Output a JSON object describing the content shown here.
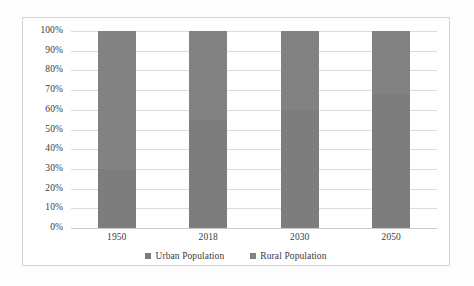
{
  "chart_data": {
    "type": "bar",
    "subtype": "100% stacked bar",
    "title": "",
    "xlabel": "",
    "ylabel": "",
    "categories": [
      "1950",
      "2018",
      "2030",
      "2050"
    ],
    "series": [
      {
        "name": "Urban Population",
        "color": "#7d7d7d",
        "values": [
          30,
          55,
          60,
          68
        ]
      },
      {
        "name": "Rural Population",
        "color": "#828282",
        "values": [
          70,
          45,
          40,
          32
        ]
      }
    ],
    "ylim": [
      0,
      100
    ],
    "y_tick_values": [
      0,
      10,
      20,
      30,
      40,
      50,
      60,
      70,
      80,
      90,
      100
    ],
    "y_tick_labels": [
      "0%",
      "10%",
      "20%",
      "30%",
      "40%",
      "50%",
      "60%",
      "70%",
      "80%",
      "90%",
      "100%"
    ],
    "grid": true,
    "grid_axis": "y",
    "legend_position": "bottom",
    "legend_entries": [
      "Urban Population",
      "Rural Population"
    ]
  },
  "style": {
    "plot_background": "#ffffff",
    "frame_border": "#d4d4d4",
    "gridline_color": "#dcdcdc",
    "text_color": "#3a3a3a"
  }
}
